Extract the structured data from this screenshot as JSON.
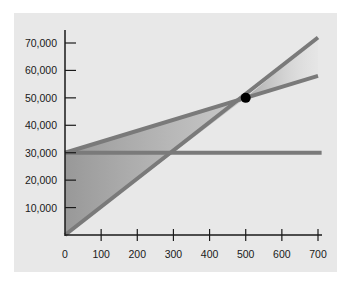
{
  "chart_data": {
    "type": "line",
    "title": "",
    "xlabel": "",
    "ylabel": "",
    "xlim": [
      0,
      720
    ],
    "ylim": [
      0,
      75000
    ],
    "x_ticks": [
      0,
      100,
      200,
      300,
      400,
      500,
      600,
      700
    ],
    "x_tick_labels": [
      "0",
      "100",
      "200",
      "300",
      "400",
      "500",
      "600",
      "700"
    ],
    "y_ticks": [
      10000,
      20000,
      30000,
      40000,
      50000,
      60000,
      70000
    ],
    "y_tick_labels": [
      "10,000",
      "20,000",
      "30,000",
      "40,000",
      "50,000",
      "60,000",
      "70,000"
    ],
    "grid": false,
    "legend": null,
    "series": [
      {
        "name": "Total revenue",
        "x": [
          0,
          700
        ],
        "y": [
          0,
          72000
        ],
        "color": "#7a7a7a"
      },
      {
        "name": "Total cost",
        "x": [
          0,
          700
        ],
        "y": [
          30000,
          58000
        ],
        "color": "#7a7a7a"
      },
      {
        "name": "Fixed cost",
        "x": [
          0,
          710
        ],
        "y": [
          30000,
          30000
        ],
        "color": "#7a7a7a"
      }
    ],
    "annotations": [
      {
        "type": "point",
        "label": "Break-even point",
        "x": 500,
        "y": 50000,
        "color": "#000000"
      },
      {
        "type": "shaded-region",
        "label": "Loss area",
        "between": [
          "Total cost",
          "Total revenue"
        ],
        "x_range": [
          0,
          500
        ]
      },
      {
        "type": "shaded-region",
        "label": "Profit area",
        "between": [
          "Total revenue",
          "Total cost"
        ],
        "x_range": [
          500,
          700
        ]
      }
    ]
  },
  "colors": {
    "panel_background": "#e8e8e8",
    "line": "#7a7a7a",
    "axis": "#1a1a1a",
    "break_even_point": "#000000"
  }
}
